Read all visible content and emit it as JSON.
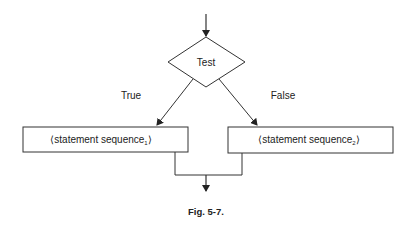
{
  "diagram": {
    "type": "flowchart",
    "decision": {
      "label": "Test"
    },
    "branches": [
      {
        "label": "True",
        "target": "statement sequence",
        "subscript": "1"
      },
      {
        "label": "False",
        "target": "statement sequence",
        "subscript": "2"
      }
    ],
    "boxes": [
      {
        "text": "⟨statement sequence",
        "subscript": "1",
        "close": "⟩"
      },
      {
        "text": "⟨statement sequence",
        "subscript": "2",
        "close": "⟩"
      }
    ],
    "caption": "Fig. 5-7.",
    "colors": {
      "stroke": "#333333",
      "background": "#ffffff",
      "text": "#222222"
    }
  }
}
